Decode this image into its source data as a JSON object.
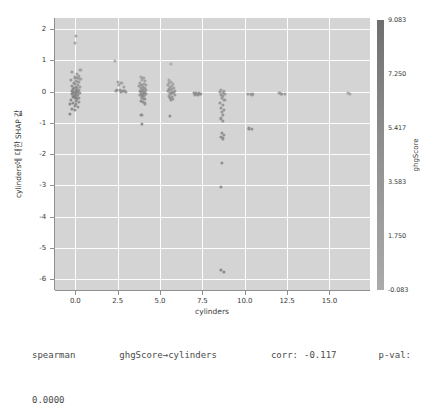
{
  "chart_data": {
    "type": "scatter",
    "title": "",
    "xlabel": "cylinders",
    "ylabel": "cylinders에 대한 SHAP 값",
    "xlim": [
      -1.2,
      17.4
    ],
    "ylim": [
      -6.35,
      2.35
    ],
    "xticks": [
      "0.0",
      "2.5",
      "5.0",
      "7.5",
      "10.0",
      "12.5",
      "15.0"
    ],
    "xtick_values": [
      0.0,
      2.5,
      5.0,
      7.5,
      10.0,
      12.5,
      15.0
    ],
    "yticks": [
      "2",
      "1",
      "0",
      "-1",
      "-2",
      "-3",
      "-4",
      "-5",
      "-6"
    ],
    "ytick_values": [
      2,
      1,
      0,
      -1,
      -2,
      -3,
      -4,
      -5,
      -6
    ],
    "grid": true,
    "grid_color": "#fdfdfd",
    "plot_bg": "#d4d4d4",
    "point_color": "#4d4d4d",
    "legend": "none",
    "colorbar": {
      "label": "ghgScore",
      "ticks": [
        "9.083",
        "7.250",
        "5.417",
        "3.583",
        "1.750",
        "-0.083"
      ],
      "tick_values": [
        9.083,
        7.25,
        5.417,
        3.583,
        1.75,
        -0.083
      ],
      "vmin": -0.083,
      "vmax": 9.083,
      "position": "right",
      "cmap_low": "#ababab",
      "cmap_high": "#6f6f6f"
    },
    "points": [
      {
        "x": 0.02,
        "y": 1.78,
        "c": 0.35
      },
      {
        "x": 0.0,
        "y": 1.55,
        "c": 0.3
      },
      {
        "x": -0.18,
        "y": 0.62,
        "c": 0.5
      },
      {
        "x": 0.08,
        "y": 0.55,
        "c": 0.45
      },
      {
        "x": 0.22,
        "y": 0.5,
        "c": 0.4
      },
      {
        "x": -0.05,
        "y": 0.45,
        "c": 0.55
      },
      {
        "x": 0.12,
        "y": 0.42,
        "c": 0.5
      },
      {
        "x": 0.3,
        "y": 0.4,
        "c": 0.35
      },
      {
        "x": -0.25,
        "y": 0.36,
        "c": 0.6
      },
      {
        "x": 0.05,
        "y": 0.33,
        "c": 0.55
      },
      {
        "x": 0.18,
        "y": 0.3,
        "c": 0.48
      },
      {
        "x": -0.1,
        "y": 0.27,
        "c": 0.62
      },
      {
        "x": 0.0,
        "y": 0.24,
        "c": 0.58
      },
      {
        "x": 0.14,
        "y": 0.21,
        "c": 0.5
      },
      {
        "x": -0.2,
        "y": 0.18,
        "c": 0.65
      },
      {
        "x": 0.06,
        "y": 0.16,
        "c": 0.6
      },
      {
        "x": 0.26,
        "y": 0.14,
        "c": 0.42
      },
      {
        "x": -0.06,
        "y": 0.12,
        "c": 0.68
      },
      {
        "x": 0.1,
        "y": 0.1,
        "c": 0.62
      },
      {
        "x": -0.14,
        "y": 0.08,
        "c": 0.7
      },
      {
        "x": 0.02,
        "y": 0.06,
        "c": 0.66
      },
      {
        "x": 0.2,
        "y": 0.05,
        "c": 0.55
      },
      {
        "x": -0.22,
        "y": 0.03,
        "c": 0.72
      },
      {
        "x": 0.08,
        "y": 0.02,
        "c": 0.68
      },
      {
        "x": -0.02,
        "y": 0.0,
        "c": 0.7
      },
      {
        "x": 0.16,
        "y": -0.01,
        "c": 0.6
      },
      {
        "x": -0.12,
        "y": -0.03,
        "c": 0.74
      },
      {
        "x": 0.04,
        "y": -0.05,
        "c": 0.7
      },
      {
        "x": 0.24,
        "y": -0.06,
        "c": 0.52
      },
      {
        "x": -0.2,
        "y": -0.08,
        "c": 0.76
      },
      {
        "x": 0.0,
        "y": -0.1,
        "c": 0.72
      },
      {
        "x": 0.12,
        "y": -0.12,
        "c": 0.64
      },
      {
        "x": -0.08,
        "y": -0.14,
        "c": 0.78
      },
      {
        "x": 0.06,
        "y": -0.16,
        "c": 0.7
      },
      {
        "x": -0.16,
        "y": -0.18,
        "c": 0.8
      },
      {
        "x": 0.18,
        "y": -0.2,
        "c": 0.58
      },
      {
        "x": -0.02,
        "y": -0.22,
        "c": 0.74
      },
      {
        "x": 0.1,
        "y": -0.25,
        "c": 0.66
      },
      {
        "x": -0.24,
        "y": -0.28,
        "c": 0.82
      },
      {
        "x": 0.02,
        "y": -0.31,
        "c": 0.76
      },
      {
        "x": 0.2,
        "y": -0.34,
        "c": 0.6
      },
      {
        "x": -0.12,
        "y": -0.37,
        "c": 0.8
      },
      {
        "x": 0.06,
        "y": -0.41,
        "c": 0.72
      },
      {
        "x": -0.05,
        "y": -0.45,
        "c": 0.78
      },
      {
        "x": 0.15,
        "y": -0.5,
        "c": 0.64
      },
      {
        "x": -0.18,
        "y": -0.55,
        "c": 0.84
      },
      {
        "x": 0.0,
        "y": -0.6,
        "c": 0.76
      },
      {
        "x": -0.3,
        "y": -0.72,
        "c": 0.88
      },
      {
        "x": 0.3,
        "y": 0.68,
        "c": 0.3
      },
      {
        "x": -0.3,
        "y": -0.4,
        "c": 0.85
      },
      {
        "x": 2.5,
        "y": 0.3,
        "c": 0.38
      },
      {
        "x": 2.72,
        "y": 0.26,
        "c": 0.35
      },
      {
        "x": 2.55,
        "y": 0.2,
        "c": 0.4
      },
      {
        "x": 2.85,
        "y": 0.16,
        "c": 0.33
      },
      {
        "x": 2.45,
        "y": 0.06,
        "c": 0.55
      },
      {
        "x": 2.62,
        "y": 0.04,
        "c": 0.58
      },
      {
        "x": 2.78,
        "y": 0.03,
        "c": 0.52
      },
      {
        "x": 2.9,
        "y": 0.02,
        "c": 0.5
      },
      {
        "x": 2.4,
        "y": 0.01,
        "c": 0.6
      },
      {
        "x": 2.68,
        "y": 0.0,
        "c": 0.56
      },
      {
        "x": 3.0,
        "y": -0.01,
        "c": 0.48
      },
      {
        "x": 2.35,
        "y": 0.98,
        "c": 0.2
      },
      {
        "x": 3.88,
        "y": 0.46,
        "c": 0.3
      },
      {
        "x": 4.02,
        "y": 0.42,
        "c": 0.28
      },
      {
        "x": 3.95,
        "y": 0.36,
        "c": 0.32
      },
      {
        "x": 4.12,
        "y": 0.33,
        "c": 0.3
      },
      {
        "x": 3.82,
        "y": 0.28,
        "c": 0.36
      },
      {
        "x": 4.05,
        "y": 0.25,
        "c": 0.34
      },
      {
        "x": 3.9,
        "y": 0.22,
        "c": 0.4
      },
      {
        "x": 4.18,
        "y": 0.2,
        "c": 0.35
      },
      {
        "x": 3.78,
        "y": 0.17,
        "c": 0.44
      },
      {
        "x": 4.0,
        "y": 0.15,
        "c": 0.42
      },
      {
        "x": 4.12,
        "y": 0.12,
        "c": 0.4
      },
      {
        "x": 3.86,
        "y": 0.1,
        "c": 0.48
      },
      {
        "x": 4.06,
        "y": 0.08,
        "c": 0.45
      },
      {
        "x": 3.94,
        "y": 0.06,
        "c": 0.5
      },
      {
        "x": 4.16,
        "y": 0.05,
        "c": 0.46
      },
      {
        "x": 3.8,
        "y": 0.03,
        "c": 0.54
      },
      {
        "x": 4.0,
        "y": 0.02,
        "c": 0.52
      },
      {
        "x": 4.1,
        "y": 0.0,
        "c": 0.5
      },
      {
        "x": 3.88,
        "y": -0.02,
        "c": 0.56
      },
      {
        "x": 4.04,
        "y": -0.04,
        "c": 0.54
      },
      {
        "x": 3.96,
        "y": -0.07,
        "c": 0.58
      },
      {
        "x": 4.14,
        "y": -0.09,
        "c": 0.55
      },
      {
        "x": 3.84,
        "y": -0.12,
        "c": 0.62
      },
      {
        "x": 4.02,
        "y": -0.15,
        "c": 0.6
      },
      {
        "x": 3.92,
        "y": -0.19,
        "c": 0.64
      },
      {
        "x": 4.08,
        "y": -0.23,
        "c": 0.62
      },
      {
        "x": 3.86,
        "y": -0.3,
        "c": 0.68
      },
      {
        "x": 4.0,
        "y": -0.34,
        "c": 0.66
      },
      {
        "x": 4.1,
        "y": -0.38,
        "c": 0.64
      },
      {
        "x": 3.9,
        "y": -0.76,
        "c": 0.74
      },
      {
        "x": 3.95,
        "y": -1.05,
        "c": 0.78
      },
      {
        "x": 5.5,
        "y": 0.36,
        "c": 0.25
      },
      {
        "x": 5.66,
        "y": 0.3,
        "c": 0.28
      },
      {
        "x": 5.55,
        "y": 0.26,
        "c": 0.3
      },
      {
        "x": 5.78,
        "y": 0.23,
        "c": 0.26
      },
      {
        "x": 5.45,
        "y": 0.2,
        "c": 0.34
      },
      {
        "x": 5.7,
        "y": 0.17,
        "c": 0.32
      },
      {
        "x": 5.58,
        "y": 0.14,
        "c": 0.36
      },
      {
        "x": 5.84,
        "y": 0.12,
        "c": 0.3
      },
      {
        "x": 5.5,
        "y": 0.09,
        "c": 0.4
      },
      {
        "x": 5.72,
        "y": 0.07,
        "c": 0.38
      },
      {
        "x": 5.6,
        "y": 0.05,
        "c": 0.42
      },
      {
        "x": 5.88,
        "y": 0.03,
        "c": 0.36
      },
      {
        "x": 5.48,
        "y": 0.01,
        "c": 0.46
      },
      {
        "x": 5.68,
        "y": 0.0,
        "c": 0.44
      },
      {
        "x": 5.8,
        "y": -0.02,
        "c": 0.4
      },
      {
        "x": 5.56,
        "y": -0.04,
        "c": 0.48
      },
      {
        "x": 5.74,
        "y": -0.06,
        "c": 0.46
      },
      {
        "x": 5.62,
        "y": -0.09,
        "c": 0.5
      },
      {
        "x": 5.86,
        "y": -0.11,
        "c": 0.44
      },
      {
        "x": 5.52,
        "y": -0.14,
        "c": 0.54
      },
      {
        "x": 5.7,
        "y": -0.16,
        "c": 0.52
      },
      {
        "x": 5.6,
        "y": -0.2,
        "c": 0.56
      },
      {
        "x": 5.78,
        "y": -0.24,
        "c": 0.5
      },
      {
        "x": 5.66,
        "y": -0.28,
        "c": 0.58
      },
      {
        "x": 5.62,
        "y": 0.88,
        "c": 0.15
      },
      {
        "x": 5.6,
        "y": -0.78,
        "c": 0.66
      },
      {
        "x": 7.1,
        "y": -0.04,
        "c": 0.55
      },
      {
        "x": 7.28,
        "y": -0.05,
        "c": 0.52
      },
      {
        "x": 7.0,
        "y": -0.06,
        "c": 0.58
      },
      {
        "x": 7.4,
        "y": -0.07,
        "c": 0.5
      },
      {
        "x": 7.18,
        "y": -0.08,
        "c": 0.56
      },
      {
        "x": 7.34,
        "y": -0.09,
        "c": 0.54
      },
      {
        "x": 7.06,
        "y": -0.1,
        "c": 0.6
      },
      {
        "x": 7.24,
        "y": -0.11,
        "c": 0.57
      },
      {
        "x": 8.6,
        "y": 0.06,
        "c": 0.42
      },
      {
        "x": 8.76,
        "y": 0.02,
        "c": 0.44
      },
      {
        "x": 8.52,
        "y": -0.02,
        "c": 0.48
      },
      {
        "x": 8.7,
        "y": -0.05,
        "c": 0.46
      },
      {
        "x": 8.82,
        "y": -0.08,
        "c": 0.44
      },
      {
        "x": 8.58,
        "y": -0.11,
        "c": 0.5
      },
      {
        "x": 8.74,
        "y": -0.14,
        "c": 0.48
      },
      {
        "x": 8.64,
        "y": -0.2,
        "c": 0.52
      },
      {
        "x": 8.8,
        "y": -0.26,
        "c": 0.5
      },
      {
        "x": 8.56,
        "y": -0.36,
        "c": 0.56
      },
      {
        "x": 8.72,
        "y": -0.44,
        "c": 0.54
      },
      {
        "x": 8.62,
        "y": -0.52,
        "c": 0.58
      },
      {
        "x": 8.78,
        "y": -0.58,
        "c": 0.56
      },
      {
        "x": 8.66,
        "y": -0.66,
        "c": 0.6
      },
      {
        "x": 8.74,
        "y": -0.74,
        "c": 0.58
      },
      {
        "x": 8.6,
        "y": -0.86,
        "c": 0.62
      },
      {
        "x": 8.7,
        "y": -0.94,
        "c": 0.6
      },
      {
        "x": 8.64,
        "y": -1.32,
        "c": 0.66
      },
      {
        "x": 8.78,
        "y": -1.38,
        "c": 0.64
      },
      {
        "x": 8.58,
        "y": -1.44,
        "c": 0.68
      },
      {
        "x": 8.72,
        "y": -1.5,
        "c": 0.66
      },
      {
        "x": 8.66,
        "y": -2.28,
        "c": 0.72
      },
      {
        "x": 8.6,
        "y": -3.05,
        "c": 0.78
      },
      {
        "x": 8.62,
        "y": -5.72,
        "c": 0.88
      },
      {
        "x": 8.78,
        "y": -5.76,
        "c": 0.86
      },
      {
        "x": 10.2,
        "y": -0.07,
        "c": 0.46
      },
      {
        "x": 10.35,
        "y": -0.08,
        "c": 0.44
      },
      {
        "x": 10.5,
        "y": -0.09,
        "c": 0.42
      },
      {
        "x": 10.42,
        "y": -0.1,
        "c": 0.45
      },
      {
        "x": 10.26,
        "y": -1.18,
        "c": 0.7
      },
      {
        "x": 10.4,
        "y": -1.2,
        "c": 0.68
      },
      {
        "x": 12.05,
        "y": -0.06,
        "c": 0.4
      },
      {
        "x": 12.2,
        "y": -0.07,
        "c": 0.38
      },
      {
        "x": 12.35,
        "y": -0.08,
        "c": 0.36
      },
      {
        "x": 12.14,
        "y": -0.09,
        "c": 0.39
      },
      {
        "x": 16.1,
        "y": -0.06,
        "c": 0.3
      },
      {
        "x": 16.2,
        "y": -0.08,
        "c": 0.28
      }
    ]
  },
  "caption": {
    "method": "spearman",
    "relation": "ghgScore→cylinders",
    "corr_label": "corr:",
    "corr_value": "-0.117",
    "pval_label": "p-val:",
    "pval_value": "0.0000"
  }
}
